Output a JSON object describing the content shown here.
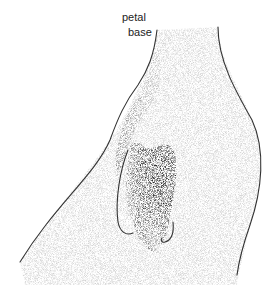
{
  "figure": {
    "style": "stippled botanical illustration",
    "labels": [
      {
        "text": "petal",
        "x": 122,
        "y": 11
      },
      {
        "text": "base",
        "x": 128,
        "y": 26
      }
    ],
    "colors": {
      "background": "#ffffff",
      "outline": "#333333",
      "stipple_dark": "#111111",
      "stipple_light": "#bbbbbb"
    }
  }
}
